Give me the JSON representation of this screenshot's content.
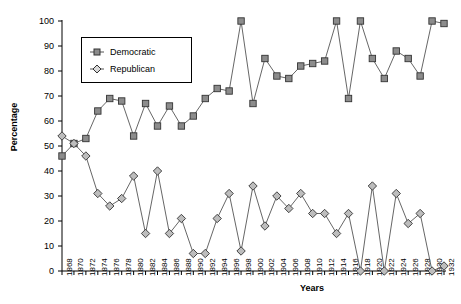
{
  "chart_data": {
    "type": "line",
    "title": "",
    "xlabel": "Years",
    "ylabel": "Percentage",
    "xlim": [
      1868,
      1932
    ],
    "ylim": [
      0,
      100
    ],
    "grid": false,
    "legend_position": "top-left-inside",
    "categories": [
      1868,
      1870,
      1872,
      1874,
      1876,
      1878,
      1880,
      1882,
      1884,
      1886,
      1888,
      1890,
      1892,
      1894,
      1896,
      1898,
      1900,
      1902,
      1904,
      1906,
      1908,
      1910,
      1912,
      1914,
      1916,
      1918,
      1920,
      1922,
      1924,
      1926,
      1928,
      1930,
      1932
    ],
    "ytick_labels": [
      "0",
      "10",
      "20",
      "30",
      "40",
      "50",
      "60",
      "70",
      "80",
      "90",
      "100"
    ],
    "ytick_values": [
      0,
      10,
      20,
      30,
      40,
      50,
      60,
      70,
      80,
      90,
      100
    ],
    "xtick_labels": [
      "1868",
      "1870",
      "1872",
      "1874",
      "1876",
      "1878",
      "1880",
      "1882",
      "1884",
      "1886",
      "1888",
      "1890",
      "1892",
      "1894",
      "1896",
      "1898",
      "1900",
      "1902",
      "1904",
      "1906",
      "1908",
      "1910",
      "1912",
      "1914",
      "1916",
      "1918",
      "1920",
      "1922",
      "1924",
      "1926",
      "1928",
      "1930",
      "1932"
    ],
    "series": [
      {
        "name": "Democratic",
        "marker": "square",
        "color": "#8c8c8c",
        "line_color": "#555555",
        "values": [
          46,
          51,
          53,
          64,
          69,
          68,
          54,
          67,
          58,
          66,
          58,
          62,
          69,
          73,
          72,
          100,
          67,
          85,
          78,
          77,
          82,
          83,
          84,
          100,
          69,
          100,
          85,
          77,
          88,
          85,
          78,
          100,
          99
        ]
      },
      {
        "name": "Republican",
        "marker": "diamond",
        "color": "#bdbdbd",
        "line_color": "#555555",
        "values": [
          54,
          51,
          46,
          31,
          26,
          29,
          38,
          15,
          40,
          15,
          21,
          7,
          7,
          21,
          31,
          8,
          34,
          18,
          30,
          25,
          31,
          23,
          23,
          15,
          23,
          0,
          34,
          0,
          31,
          19,
          23,
          0,
          2
        ]
      }
    ]
  },
  "legend": {
    "items": [
      {
        "label": "Democratic",
        "icon": "square-marker-icon"
      },
      {
        "label": "Republican",
        "icon": "diamond-marker-icon"
      }
    ]
  }
}
